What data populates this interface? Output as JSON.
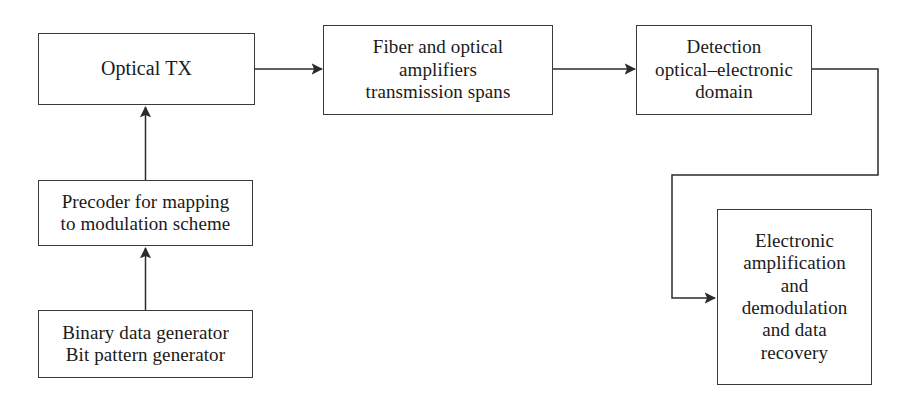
{
  "diagram": {
    "type": "block-diagram",
    "background_color": "#ffffff",
    "line_color": "#3a3a3a",
    "text_color": "#1a1a1a",
    "nodes": [
      {
        "id": "optical-tx",
        "label": "Optical TX",
        "lines": [
          "Optical TX"
        ],
        "x": 38,
        "y": 33,
        "width": 217,
        "height": 72
      },
      {
        "id": "fiber",
        "label": "Fiber and optical\namplifiers\ntransmission spans",
        "lines": [
          "Fiber and optical",
          "amplifiers",
          "transmission spans"
        ],
        "x": 323,
        "y": 25,
        "width": 230,
        "height": 90
      },
      {
        "id": "detection",
        "label": "Detection\noptical–electronic\ndomain",
        "lines": [
          "Detection",
          "optical–electronic",
          "domain"
        ],
        "x": 636,
        "y": 25,
        "width": 176,
        "height": 90
      },
      {
        "id": "precoder",
        "label": "Precoder for mapping\nto modulation scheme",
        "lines": [
          "Precoder for mapping",
          "to modulation scheme"
        ],
        "x": 38,
        "y": 180,
        "width": 215,
        "height": 66
      },
      {
        "id": "binary",
        "label": "Binary data generator\nBit pattern generator",
        "lines": [
          "Binary data generator",
          "Bit pattern generator"
        ],
        "x": 38,
        "y": 310,
        "width": 215,
        "height": 68
      },
      {
        "id": "electronic",
        "label": "Electronic\namplification\nand\ndemodulation\nand data\nrecovery",
        "lines": [
          "Electronic",
          "amplification",
          "and",
          "demodulation",
          "and data",
          "recovery"
        ],
        "x": 717,
        "y": 209,
        "width": 155,
        "height": 176
      }
    ],
    "edges": [
      {
        "id": "edge-binary-to-precoder",
        "from": "binary",
        "to": "precoder",
        "direction": "up",
        "arrow": true
      },
      {
        "id": "edge-precoder-to-optical-tx",
        "from": "precoder",
        "to": "optical-tx",
        "direction": "up",
        "arrow": true
      },
      {
        "id": "edge-optical-tx-to-fiber",
        "from": "optical-tx",
        "to": "fiber",
        "direction": "right",
        "arrow": true
      },
      {
        "id": "edge-fiber-to-detection",
        "from": "fiber",
        "to": "detection",
        "direction": "right",
        "arrow": true
      },
      {
        "id": "edge-detection-to-electronic",
        "from": "detection",
        "to": "electronic",
        "direction": "routed-right-down-left-down-right",
        "arrow": true
      }
    ]
  }
}
